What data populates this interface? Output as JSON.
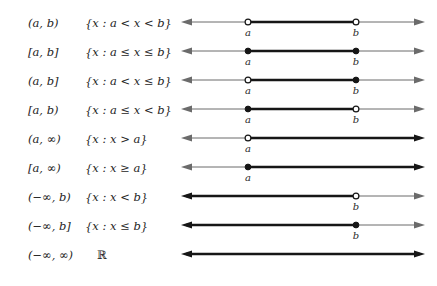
{
  "figure": {
    "colors": {
      "ink": "#1a1a1a",
      "thin_line": "#6b6b6b",
      "thick_line": "#161616",
      "background": "#ffffff",
      "open_dot_fill": "#ffffff",
      "closed_dot_fill": "#161616"
    },
    "geometry": {
      "line_left_x": 6,
      "line_right_x": 240,
      "point_a_x": 68,
      "point_b_x": 176,
      "row_height": 29,
      "first_row_y": 14
    }
  },
  "columns": {
    "interval_header": "",
    "setbuilder_header": "",
    "diagram_header": ""
  },
  "rows": [
    {
      "interval": "(a, b)",
      "setbuilder": "{x : a < x < b}",
      "left_endpoint": {
        "label": "a",
        "type": "open",
        "x": 68
      },
      "right_endpoint": {
        "label": "b",
        "type": "open",
        "x": 176
      },
      "segment": {
        "from": 68,
        "to": 176
      },
      "left_arrow": true,
      "right_arrow": true
    },
    {
      "interval": "[a, b]",
      "setbuilder": "{x : a ≤ x ≤ b}",
      "left_endpoint": {
        "label": "a",
        "type": "closed",
        "x": 68
      },
      "right_endpoint": {
        "label": "b",
        "type": "closed",
        "x": 176
      },
      "segment": {
        "from": 68,
        "to": 176
      },
      "left_arrow": true,
      "right_arrow": true
    },
    {
      "interval": "(a, b]",
      "setbuilder": "{x : a < x ≤ b}",
      "left_endpoint": {
        "label": "a",
        "type": "open",
        "x": 68
      },
      "right_endpoint": {
        "label": "b",
        "type": "closed",
        "x": 176
      },
      "segment": {
        "from": 68,
        "to": 176
      },
      "left_arrow": true,
      "right_arrow": true
    },
    {
      "interval": "[a, b)",
      "setbuilder": "{x : a ≤ x < b}",
      "left_endpoint": {
        "label": "a",
        "type": "closed",
        "x": 68
      },
      "right_endpoint": {
        "label": "b",
        "type": "open",
        "x": 176
      },
      "segment": {
        "from": 68,
        "to": 176
      },
      "left_arrow": true,
      "right_arrow": true
    },
    {
      "interval": "(a, ∞)",
      "setbuilder": "{x : x > a}",
      "left_endpoint": {
        "label": "a",
        "type": "open",
        "x": 68
      },
      "right_endpoint": null,
      "segment": {
        "from": 68,
        "to": 240
      },
      "left_arrow": true,
      "right_arrow": true
    },
    {
      "interval": "[a, ∞)",
      "setbuilder": "{x : x ≥ a}",
      "left_endpoint": {
        "label": "a",
        "type": "closed",
        "x": 68
      },
      "right_endpoint": null,
      "segment": {
        "from": 68,
        "to": 240
      },
      "left_arrow": true,
      "right_arrow": true
    },
    {
      "interval": "(−∞, b)",
      "setbuilder": "{x : x < b}",
      "left_endpoint": null,
      "right_endpoint": {
        "label": "b",
        "type": "open",
        "x": 176
      },
      "segment": {
        "from": 6,
        "to": 176
      },
      "left_arrow": true,
      "right_arrow": true
    },
    {
      "interval": "(−∞, b]",
      "setbuilder": "{x : x ≤ b}",
      "left_endpoint": null,
      "right_endpoint": {
        "label": "b",
        "type": "closed",
        "x": 176
      },
      "segment": {
        "from": 6,
        "to": 176
      },
      "left_arrow": true,
      "right_arrow": true
    },
    {
      "interval": "(−∞, ∞)",
      "setbuilder": "ℝ",
      "setbuilder_plain": true,
      "left_endpoint": null,
      "right_endpoint": null,
      "segment": {
        "from": 6,
        "to": 240
      },
      "left_arrow": true,
      "right_arrow": true
    }
  ]
}
